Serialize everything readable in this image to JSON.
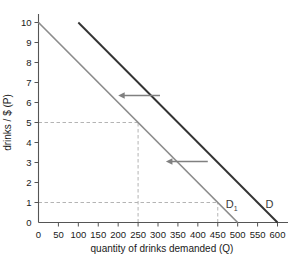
{
  "chart_data": {
    "type": "line",
    "title": "",
    "xlabel": "quantity of drinks demanded (Q)",
    "ylabel": "drinks / $ (P)",
    "xlim": [
      0,
      600
    ],
    "ylim": [
      0,
      10
    ],
    "grid": false,
    "legend_position": "inline-right",
    "xticks": [
      0,
      50,
      100,
      150,
      200,
      250,
      300,
      350,
      400,
      450,
      500,
      550,
      600
    ],
    "xtick_labels": [
      "0",
      "50",
      "100",
      "150",
      "200",
      "250",
      "300",
      "350",
      "400",
      "450",
      "500",
      "550",
      "600"
    ],
    "yticks": [
      0,
      1,
      2,
      3,
      4,
      5,
      6,
      7,
      8,
      9,
      10
    ],
    "ytick_labels": [
      "0",
      "1",
      "2",
      "3",
      "4",
      "5",
      "6",
      "7",
      "8",
      "9",
      "10"
    ],
    "series": [
      {
        "name": "D",
        "label": "D",
        "label_main": "D",
        "label_sub": "",
        "color": "#333333",
        "width": 1.9,
        "points": [
          [
            100,
            10
          ],
          [
            600,
            0
          ]
        ],
        "x": [
          100,
          600
        ],
        "values": [
          10,
          0
        ],
        "label_at": [
          600,
          0.75
        ]
      },
      {
        "name": "D1",
        "label": "D₁",
        "label_main": "D",
        "label_sub": "1",
        "color": "#8c8c8c",
        "width": 1.7,
        "points": [
          [
            0,
            10
          ],
          [
            500,
            0
          ]
        ],
        "x": [
          0,
          500
        ],
        "values": [
          10,
          0
        ],
        "label_at": [
          500,
          0.75
        ]
      }
    ],
    "guides": [
      {
        "name": "price-5-horizontal",
        "type": "h",
        "value": 5,
        "from": 0,
        "to": 250
      },
      {
        "name": "quantity-250-vertical",
        "type": "v",
        "value": 250,
        "from": 0,
        "to": 5
      },
      {
        "name": "price-1-horizontal",
        "type": "h",
        "value": 1,
        "from": 0,
        "to": 450
      },
      {
        "name": "quantity-450-vertical",
        "type": "v",
        "value": 450,
        "from": 0,
        "to": 1
      }
    ],
    "annotations": [
      {
        "name": "shift-arrow-upper",
        "type": "arrow",
        "direction": "left",
        "from": [
          305,
          6.35
        ],
        "to": [
          200,
          6.35
        ]
      },
      {
        "name": "shift-arrow-lower",
        "type": "arrow",
        "direction": "left",
        "from": [
          425,
          3.05
        ],
        "to": [
          320,
          3.05
        ]
      }
    ],
    "colors": {
      "axis": "#555555",
      "text": "#1a1a1a",
      "guide": "#b4b4b4",
      "arrow": "#808080",
      "demand_original": "#333333",
      "demand_shifted": "#8c8c8c",
      "background": "#ffffff"
    }
  }
}
